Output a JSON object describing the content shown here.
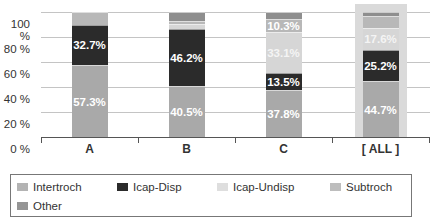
{
  "chart_data": {
    "type": "bar",
    "stacked": true,
    "title": "",
    "xlabel": "",
    "ylabel": "",
    "ylim": [
      0,
      100
    ],
    "y_ticks": [
      "0 %",
      "20 %",
      "40 %",
      "60 %",
      "80 %",
      "100 %"
    ],
    "grid": true,
    "legend_position": "bottom",
    "categories": [
      "A",
      "B",
      "C",
      "[ ALL ]"
    ],
    "series": [
      {
        "name": "Intertroch",
        "color": "#a9a9a9",
        "values": [
          57.3,
          40.5,
          37.8,
          44.7
        ],
        "labels": [
          "57.3%",
          "40.5%",
          "37.8%",
          "44.7%"
        ]
      },
      {
        "name": "Icap-Disp",
        "color": "#2b2b2b",
        "values": [
          32.7,
          46.2,
          13.5,
          25.2
        ],
        "labels": [
          "32.7%",
          "46.2%",
          "13.5%",
          "25.2%"
        ]
      },
      {
        "name": "Icap-Undisp",
        "color": "#d6d6d6",
        "values": [
          0.0,
          3.5,
          33.1,
          17.6
        ],
        "labels": [
          "",
          "",
          "33.1%",
          "17.6%"
        ]
      },
      {
        "name": "Subtroch",
        "color": "#b8b8b8",
        "values": [
          10.0,
          2.5,
          10.3,
          9.5
        ],
        "labels": [
          "",
          "",
          "10.3%",
          ""
        ]
      },
      {
        "name": "Other",
        "color": "#8e8e8e",
        "values": [
          0.0,
          7.3,
          5.3,
          3.0
        ],
        "labels": [
          "",
          "",
          "",
          ""
        ]
      }
    ],
    "highlighted_category": "[ ALL ]"
  },
  "legend": {
    "items": [
      {
        "label": "Intertroch",
        "color": "#b3b3b3"
      },
      {
        "label": "Icap-Disp",
        "color": "#2b2b2b"
      },
      {
        "label": "Icap-Undisp",
        "color": "#dedede"
      },
      {
        "label": "Subtroch",
        "color": "#bdbdbd"
      },
      {
        "label": "Other",
        "color": "#959595"
      }
    ]
  }
}
